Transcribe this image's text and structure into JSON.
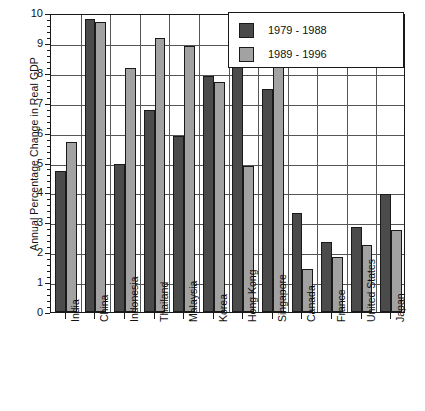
{
  "chart_data": {
    "type": "bar",
    "title": "",
    "xlabel": "",
    "ylabel": "Annual Percentage Change in Real GDP",
    "ylim": [
      0,
      10
    ],
    "ytick_step": 1,
    "yticks": [
      "0",
      "1",
      "2",
      "3",
      "4",
      "5",
      "6",
      "7",
      "8",
      "9",
      "10"
    ],
    "grid": true,
    "legend_position": "top-right",
    "categories": [
      "India",
      "China",
      "Indonesia",
      "Thailand",
      "Malaysia",
      "Korea",
      "Hong Kong",
      "Singapore",
      "Canada",
      "France",
      "United States",
      "Japan"
    ],
    "series": [
      {
        "name": "1979 - 1988",
        "color": "#4b4b4b",
        "values": [
          4.7,
          9.8,
          4.95,
          6.75,
          5.9,
          7.9,
          8.3,
          7.45,
          3.3,
          2.35,
          2.85,
          3.95
        ]
      },
      {
        "name": "1989 - 1996",
        "color": "#a2a2a2",
        "values": [
          5.7,
          9.7,
          8.15,
          9.15,
          8.9,
          7.7,
          4.9,
          8.7,
          1.45,
          1.85,
          2.25,
          2.75
        ]
      }
    ]
  },
  "axis": {
    "y_title": "Annual Percentage Change in Real GDP"
  },
  "legend": {
    "entries": [
      {
        "label": "1979 - 1988",
        "swatch": "dark-gray-swatch"
      },
      {
        "label": "1989 - 1996",
        "swatch": "light-gray-swatch"
      }
    ]
  }
}
